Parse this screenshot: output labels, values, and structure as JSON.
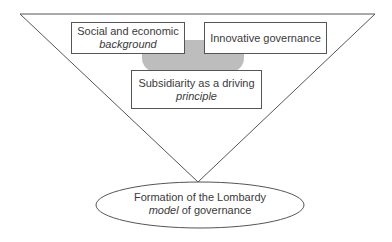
{
  "diagram": {
    "type": "inverted-triangle-funnel",
    "colors": {
      "stroke": "#555555",
      "blob": "#bdbdbd",
      "background": "#ffffff"
    },
    "boxes": [
      {
        "id": "social-economic",
        "line1": "Social and economic",
        "line2_italic": "background"
      },
      {
        "id": "innovative-governance",
        "line1": "Innovative governance"
      },
      {
        "id": "subsidiarity",
        "line1": "Subsidiarity as a driving",
        "line2_italic": "principle"
      }
    ],
    "outcome": {
      "line1": "Formation of the Lombardy",
      "line2_italic": "model",
      "line2_rest": " of governance"
    }
  }
}
